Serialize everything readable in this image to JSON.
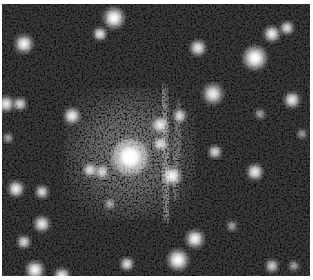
{
  "image": {
    "description": "Grayscale astronomical field with a bright central galaxy and a faint vertical lensing arc",
    "background_color": "#3a3a3a",
    "noise_color": "#0e0e0e",
    "glow": {
      "cx": 128,
      "cy": 150,
      "r": 55,
      "opacity": 0.45
    },
    "arcs": [
      {
        "x1": 161,
        "y1": 85,
        "x2": 166,
        "y2": 215,
        "width": 9,
        "opacity": 0.45
      },
      {
        "x1": 178,
        "y1": 100,
        "x2": 172,
        "y2": 195,
        "width": 6,
        "opacity": 0.35
      }
    ],
    "sources": [
      {
        "x": 112,
        "y": 14,
        "r": 8,
        "b": 1.0
      },
      {
        "x": 98,
        "y": 30,
        "r": 5,
        "b": 0.95
      },
      {
        "x": 22,
        "y": 40,
        "r": 7,
        "b": 0.95
      },
      {
        "x": 18,
        "y": 100,
        "r": 5,
        "b": 0.85
      },
      {
        "x": 4,
        "y": 100,
        "r": 6,
        "b": 0.9
      },
      {
        "x": 70,
        "y": 112,
        "r": 6,
        "b": 0.95
      },
      {
        "x": 128,
        "y": 153,
        "r": 14,
        "b": 1.0
      },
      {
        "x": 158,
        "y": 121,
        "r": 6,
        "b": 0.9
      },
      {
        "x": 158,
        "y": 140,
        "r": 5,
        "b": 0.85
      },
      {
        "x": 178,
        "y": 112,
        "r": 5,
        "b": 0.8
      },
      {
        "x": 170,
        "y": 172,
        "r": 7,
        "b": 0.95
      },
      {
        "x": 211,
        "y": 90,
        "r": 8,
        "b": 0.85
      },
      {
        "x": 196,
        "y": 44,
        "r": 6,
        "b": 0.9
      },
      {
        "x": 253,
        "y": 54,
        "r": 9,
        "b": 1.0
      },
      {
        "x": 270,
        "y": 30,
        "r": 6,
        "b": 0.95
      },
      {
        "x": 285,
        "y": 24,
        "r": 5,
        "b": 0.9
      },
      {
        "x": 290,
        "y": 96,
        "r": 6,
        "b": 0.9
      },
      {
        "x": 258,
        "y": 110,
        "r": 4,
        "b": 0.6
      },
      {
        "x": 213,
        "y": 148,
        "r": 5,
        "b": 0.85
      },
      {
        "x": 253,
        "y": 168,
        "r": 6,
        "b": 0.95
      },
      {
        "x": 14,
        "y": 185,
        "r": 6,
        "b": 0.95
      },
      {
        "x": 40,
        "y": 188,
        "r": 5,
        "b": 0.85
      },
      {
        "x": 88,
        "y": 166,
        "r": 5,
        "b": 0.85
      },
      {
        "x": 100,
        "y": 168,
        "r": 5,
        "b": 0.8
      },
      {
        "x": 40,
        "y": 220,
        "r": 6,
        "b": 0.9
      },
      {
        "x": 22,
        "y": 238,
        "r": 5,
        "b": 0.85
      },
      {
        "x": 33,
        "y": 266,
        "r": 7,
        "b": 0.95
      },
      {
        "x": 60,
        "y": 272,
        "r": 6,
        "b": 0.9
      },
      {
        "x": 125,
        "y": 260,
        "r": 5,
        "b": 0.9
      },
      {
        "x": 108,
        "y": 200,
        "r": 4,
        "b": 0.6
      },
      {
        "x": 193,
        "y": 235,
        "r": 7,
        "b": 0.95
      },
      {
        "x": 176,
        "y": 256,
        "r": 8,
        "b": 1.0
      },
      {
        "x": 230,
        "y": 222,
        "r": 4,
        "b": 0.6
      },
      {
        "x": 270,
        "y": 262,
        "r": 5,
        "b": 0.75
      },
      {
        "x": 292,
        "y": 262,
        "r": 4,
        "b": 0.6
      },
      {
        "x": 6,
        "y": 134,
        "r": 4,
        "b": 0.6
      },
      {
        "x": 300,
        "y": 130,
        "r": 4,
        "b": 0.55
      }
    ]
  }
}
